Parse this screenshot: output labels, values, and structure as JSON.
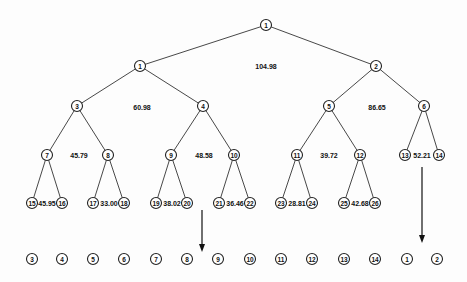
{
  "tree": {
    "nodes": [
      {
        "id": "r",
        "label": "1",
        "x": 266,
        "y": 25
      },
      {
        "id": "a1",
        "label": "1",
        "x": 140,
        "y": 66
      },
      {
        "id": "a2",
        "label": "2",
        "x": 376,
        "y": 66
      },
      {
        "id": "b3",
        "label": "3",
        "x": 77,
        "y": 106
      },
      {
        "id": "b4",
        "label": "4",
        "x": 203,
        "y": 106
      },
      {
        "id": "b5",
        "label": "5",
        "x": 329,
        "y": 106
      },
      {
        "id": "b6",
        "label": "6",
        "x": 424,
        "y": 106
      },
      {
        "id": "c7",
        "label": "7",
        "x": 47,
        "y": 155
      },
      {
        "id": "c8",
        "label": "8",
        "x": 108,
        "y": 155
      },
      {
        "id": "c9",
        "label": "9",
        "x": 171,
        "y": 155
      },
      {
        "id": "c10",
        "label": "10",
        "x": 234,
        "y": 155
      },
      {
        "id": "c11",
        "label": "11",
        "x": 297,
        "y": 155
      },
      {
        "id": "c12",
        "label": "12",
        "x": 360,
        "y": 155
      },
      {
        "id": "c13",
        "label": "13",
        "x": 405,
        "y": 155
      },
      {
        "id": "c14",
        "label": "14",
        "x": 439,
        "y": 155
      },
      {
        "id": "d15",
        "label": "15",
        "x": 32,
        "y": 203
      },
      {
        "id": "d16",
        "label": "16",
        "x": 62,
        "y": 203
      },
      {
        "id": "d17",
        "label": "17",
        "x": 93,
        "y": 203
      },
      {
        "id": "d18",
        "label": "18",
        "x": 124,
        "y": 203
      },
      {
        "id": "d19",
        "label": "19",
        "x": 156,
        "y": 203
      },
      {
        "id": "d20",
        "label": "20",
        "x": 187,
        "y": 203
      },
      {
        "id": "d21",
        "label": "21",
        "x": 219,
        "y": 203
      },
      {
        "id": "d22",
        "label": "22",
        "x": 250,
        "y": 203
      },
      {
        "id": "d23",
        "label": "23",
        "x": 281,
        "y": 203
      },
      {
        "id": "d24",
        "label": "24",
        "x": 312,
        "y": 203
      },
      {
        "id": "d25",
        "label": "25",
        "x": 344,
        "y": 203
      },
      {
        "id": "d26",
        "label": "26",
        "x": 375,
        "y": 203
      }
    ],
    "edges": [
      [
        "r",
        "a1"
      ],
      [
        "r",
        "a2"
      ],
      [
        "a1",
        "b3"
      ],
      [
        "a1",
        "b4"
      ],
      [
        "a2",
        "b5"
      ],
      [
        "a2",
        "b6"
      ],
      [
        "b3",
        "c7"
      ],
      [
        "b3",
        "c8"
      ],
      [
        "b4",
        "c9"
      ],
      [
        "b4",
        "c10"
      ],
      [
        "b5",
        "c11"
      ],
      [
        "b5",
        "c12"
      ],
      [
        "b6",
        "c13"
      ],
      [
        "b6",
        "c14"
      ],
      [
        "c7",
        "d15"
      ],
      [
        "c7",
        "d16"
      ],
      [
        "c8",
        "d17"
      ],
      [
        "c8",
        "d18"
      ],
      [
        "c9",
        "d19"
      ],
      [
        "c9",
        "d20"
      ],
      [
        "c10",
        "d21"
      ],
      [
        "c10",
        "d22"
      ],
      [
        "c11",
        "d23"
      ],
      [
        "c11",
        "d24"
      ],
      [
        "c12",
        "d25"
      ],
      [
        "c12",
        "d26"
      ]
    ],
    "values": [
      {
        "text": "104.98",
        "x": 266,
        "y": 66
      },
      {
        "text": "60.98",
        "x": 142,
        "y": 107
      },
      {
        "text": "86.65",
        "x": 377,
        "y": 107
      },
      {
        "text": "45.79",
        "x": 79,
        "y": 155
      },
      {
        "text": "48.58",
        "x": 204,
        "y": 155
      },
      {
        "text": "39.72",
        "x": 329,
        "y": 155
      },
      {
        "text": "52.21",
        "x": 422,
        "y": 155
      },
      {
        "text": "45.95",
        "x": 47,
        "y": 203
      },
      {
        "text": "33.00",
        "x": 109,
        "y": 203
      },
      {
        "text": "38.02",
        "x": 172,
        "y": 203
      },
      {
        "text": "36.46",
        "x": 235,
        "y": 203
      },
      {
        "text": "28.81",
        "x": 297,
        "y": 203
      },
      {
        "text": "42.68",
        "x": 360,
        "y": 203
      }
    ],
    "bottom_row": [
      {
        "label": "3",
        "x": 32
      },
      {
        "label": "4",
        "x": 62
      },
      {
        "label": "5",
        "x": 93
      },
      {
        "label": "6",
        "x": 124
      },
      {
        "label": "7",
        "x": 156
      },
      {
        "label": "8",
        "x": 187
      },
      {
        "label": "9",
        "x": 218
      },
      {
        "label": "10",
        "x": 250
      },
      {
        "label": "11",
        "x": 281
      },
      {
        "label": "12",
        "x": 312
      },
      {
        "label": "13",
        "x": 344
      },
      {
        "label": "14",
        "x": 375
      },
      {
        "label": "1",
        "x": 407
      },
      {
        "label": "2",
        "x": 437
      }
    ],
    "bottom_row_y": 259,
    "arrows": [
      {
        "x": 202,
        "y1": 210,
        "y2": 252
      },
      {
        "x": 422,
        "y1": 167,
        "y2": 243
      }
    ]
  }
}
